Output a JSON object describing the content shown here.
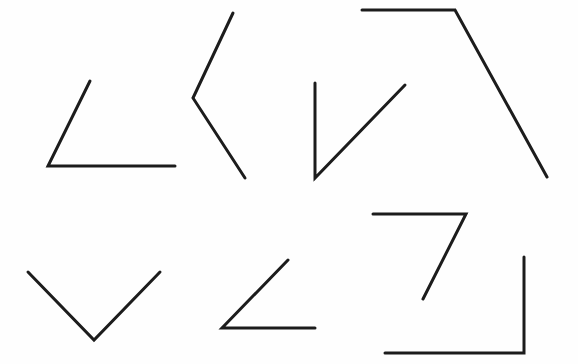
{
  "diagram": {
    "background": "#fefefe",
    "stroke_color": "#1c1c1c",
    "stroke_width": 3,
    "angles": [
      {
        "id": "angle-1",
        "points": [
          [
            90,
            81
          ],
          [
            48,
            166
          ],
          [
            175,
            166
          ]
        ]
      },
      {
        "id": "angle-2",
        "points": [
          [
            233,
            13
          ],
          [
            193,
            98
          ],
          [
            245,
            178
          ]
        ]
      },
      {
        "id": "angle-3",
        "points": [
          [
            315,
            83
          ],
          [
            315,
            178
          ],
          [
            405,
            85
          ]
        ]
      },
      {
        "id": "angle-4",
        "points": [
          [
            362,
            10
          ],
          [
            455,
            10
          ],
          [
            547,
            177
          ]
        ]
      },
      {
        "id": "angle-5",
        "points": [
          [
            28,
            272
          ],
          [
            94,
            340
          ],
          [
            160,
            272
          ]
        ]
      },
      {
        "id": "angle-6",
        "points": [
          [
            288,
            260
          ],
          [
            222,
            328
          ],
          [
            315,
            328
          ]
        ]
      },
      {
        "id": "angle-7",
        "points": [
          [
            373,
            214
          ],
          [
            466,
            214
          ],
          [
            423,
            299
          ]
        ]
      },
      {
        "id": "angle-8",
        "points": [
          [
            385,
            353
          ],
          [
            524,
            353
          ],
          [
            524,
            257
          ]
        ]
      }
    ]
  }
}
